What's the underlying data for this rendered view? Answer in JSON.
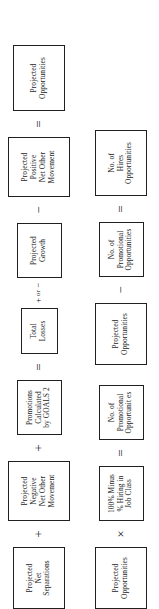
{
  "diagram": {
    "orientation": "rotated-90-ccw",
    "background_color": "#ffffff",
    "box_border_color": "#202020",
    "text_color": "#1a1a1a",
    "rows": [
      {
        "id": "row-1",
        "name": "projected-opportunities-equation",
        "sequence": [
          {
            "kind": "box",
            "name": "projected-net-separations",
            "label": "Projected\nNet\nSeparations",
            "size": "box-lg"
          },
          {
            "kind": "operator",
            "name": "operator-plus",
            "label": "+"
          },
          {
            "kind": "box",
            "name": "projected-negative-net-other-movement",
            "label": "Projected\nNegative\nNet Other\nMovement",
            "size": "box-tall"
          },
          {
            "kind": "operator",
            "name": "operator-plus",
            "label": "+"
          },
          {
            "kind": "box",
            "name": "promotions-calculated-by-goals-2",
            "label": "Promotions\nCalculated\nby GOALS 2",
            "size": "box-md"
          },
          {
            "kind": "operator",
            "name": "operator-equals",
            "label": "="
          },
          {
            "kind": "box",
            "name": "total-losses",
            "label": "Total\nLosses",
            "size": "box-sm"
          },
          {
            "kind": "operator-plusminus",
            "name": "operator-plus-or-minus",
            "plus": "+",
            "or": "or",
            "minus": "−"
          },
          {
            "kind": "box",
            "name": "projected-growth",
            "label": "Projected\nGrowth",
            "size": "box-md"
          },
          {
            "kind": "operator",
            "name": "operator-minus",
            "label": "−"
          },
          {
            "kind": "box",
            "name": "projected-positive-net-other-movement",
            "label": "Projected\nPositive\nNet Other\nMovement",
            "size": "box-tall"
          },
          {
            "kind": "operator",
            "name": "operator-equals",
            "label": "="
          },
          {
            "kind": "box",
            "name": "projected-opportunities-result",
            "label": "Projected\nOpportunities",
            "size": "box-wide"
          }
        ]
      },
      {
        "id": "row-2",
        "name": "hires-opportunities-equation",
        "sequence": [
          {
            "kind": "box",
            "name": "projected-opportunities-input",
            "label": "Projected\nOpportunities",
            "size": "box-lg"
          },
          {
            "kind": "operator",
            "name": "operator-multiply",
            "label": "×"
          },
          {
            "kind": "box",
            "name": "percent-minus-hiring-in-job-class",
            "label": "100% Minus\n% Hiring in\nJob Class",
            "size": "box-md"
          },
          {
            "kind": "operator",
            "name": "operator-equals",
            "label": "="
          },
          {
            "kind": "box",
            "name": "no-of-promotional-opportunities-result",
            "label": "No. of\nPromotional\nOpportunit es",
            "size": "box-md"
          },
          {
            "kind": "gap",
            "name": "row-gap"
          },
          {
            "kind": "box",
            "name": "projected-opportunities-second",
            "label": "Projected\nOpportunities",
            "size": "box-lg"
          },
          {
            "kind": "operator",
            "name": "operator-minus",
            "label": "−"
          },
          {
            "kind": "box",
            "name": "no-of-promotional-opportunities-input",
            "label": "No. of\nPromotional\nOpportunities",
            "size": "box-md"
          },
          {
            "kind": "operator",
            "name": "operator-equals",
            "label": "="
          },
          {
            "kind": "box",
            "name": "no-of-hires-opportunities-result",
            "label": "No. of\nHires\nOpportunities",
            "size": "box-wide"
          }
        ]
      }
    ]
  }
}
